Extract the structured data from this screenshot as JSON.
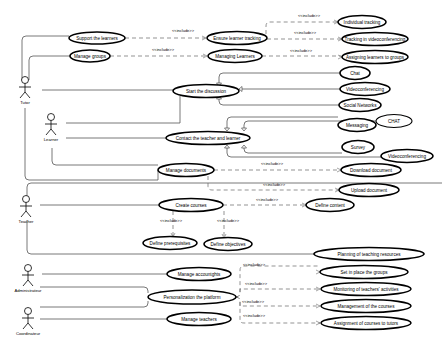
{
  "diagram": {
    "type": "UML use case diagram",
    "actors": [
      {
        "id": "tutor",
        "label": "Tutor",
        "x": 18,
        "y": 90
      },
      {
        "id": "learner",
        "label": "Learner",
        "x": 50,
        "y": 125
      },
      {
        "id": "teacher",
        "label": "Teacher",
        "x": 25,
        "y": 210
      },
      {
        "id": "administrator",
        "label": "Administrateur",
        "x": 28,
        "y": 273
      },
      {
        "id": "coordinator",
        "label": "Coordinateur",
        "x": 28,
        "y": 318
      }
    ],
    "use_cases": [
      {
        "id": "support",
        "label": "Support the learners",
        "cx": 97,
        "cy": 38,
        "rx": 28,
        "ry": 6
      },
      {
        "id": "manage_groups",
        "label": "Manage groups",
        "cx": 90,
        "cy": 56,
        "rx": 20,
        "ry": 6
      },
      {
        "id": "ensure_tracking",
        "label": "Ensure learner tracking",
        "cx": 237,
        "cy": 38,
        "rx": 30,
        "ry": 6.5
      },
      {
        "id": "managing_learners",
        "label": "Managing Learners",
        "cx": 235,
        "cy": 56,
        "rx": 27,
        "ry": 6.5
      },
      {
        "id": "individual_tracking",
        "label": "Individual tracking",
        "cx": 362,
        "cy": 22,
        "rx": 24,
        "ry": 6.5
      },
      {
        "id": "tracking_video",
        "label": "Tracking in videoconferencing",
        "cx": 375,
        "cy": 39,
        "rx": 33,
        "ry": 6.5
      },
      {
        "id": "assigning_groups",
        "label": "Assigning learners to groups",
        "cx": 375,
        "cy": 57,
        "rx": 33,
        "ry": 6.5
      },
      {
        "id": "start_discussion",
        "label": "Start the discussion",
        "cx": 206,
        "cy": 91,
        "rx": 33,
        "ry": 6.5
      },
      {
        "id": "chat",
        "label": "Chat",
        "cx": 355,
        "cy": 73,
        "rx": 15,
        "ry": 6.5
      },
      {
        "id": "videoconf1",
        "label": "Videoconferencing",
        "cx": 365,
        "cy": 89,
        "rx": 25,
        "ry": 6.5
      },
      {
        "id": "social",
        "label": "Social Networks",
        "cx": 360,
        "cy": 105,
        "rx": 21,
        "ry": 6.5
      },
      {
        "id": "contact",
        "label": "Contact the teacher and learner",
        "cx": 208,
        "cy": 138,
        "rx": 42,
        "ry": 6.5
      },
      {
        "id": "messaging",
        "label": "Messaging",
        "cx": 357,
        "cy": 125,
        "rx": 19,
        "ry": 6.5
      },
      {
        "id": "chat2",
        "label": "CHAT",
        "cx": 394,
        "cy": 121,
        "rx": 18,
        "ry": 6.5
      },
      {
        "id": "survey",
        "label": "Survey",
        "cx": 358,
        "cy": 147,
        "rx": 16,
        "ry": 6.5
      },
      {
        "id": "videoconf2",
        "label": "Videoconferencing",
        "cx": 407,
        "cy": 156,
        "rx": 26,
        "ry": 6.5
      },
      {
        "id": "manage_docs",
        "label": "Manage documents",
        "cx": 186,
        "cy": 170,
        "rx": 28,
        "ry": 6.5
      },
      {
        "id": "download_doc",
        "label": "Download document",
        "cx": 371,
        "cy": 170,
        "rx": 30,
        "ry": 6.5
      },
      {
        "id": "upload_doc",
        "label": "Upload document",
        "cx": 369,
        "cy": 190,
        "rx": 30,
        "ry": 6.5
      },
      {
        "id": "create_courses",
        "label": "Create courses",
        "cx": 191,
        "cy": 205,
        "rx": 32,
        "ry": 6.5
      },
      {
        "id": "define_content",
        "label": "Define content",
        "cx": 330,
        "cy": 205,
        "rx": 24,
        "ry": 6.5
      },
      {
        "id": "define_prereq",
        "label": "Define prerequisites",
        "cx": 170,
        "cy": 243,
        "rx": 27,
        "ry": 6.5
      },
      {
        "id": "define_obj",
        "label": "Define objectives",
        "cx": 228,
        "cy": 244,
        "rx": 24,
        "ry": 6.5
      },
      {
        "id": "planning",
        "label": "Planning of teaching resources",
        "cx": 369,
        "cy": 254,
        "rx": 55,
        "ry": 6.5
      },
      {
        "id": "manage_accounts",
        "label": "Manage accountghts",
        "cx": 199,
        "cy": 274,
        "rx": 32,
        "ry": 6.5
      },
      {
        "id": "personalization",
        "label": "Personalization the platform",
        "cx": 192,
        "cy": 297,
        "rx": 44,
        "ry": 7
      },
      {
        "id": "manage_teachers",
        "label": "Manage teachers",
        "cx": 199,
        "cy": 319,
        "rx": 32,
        "ry": 6.5
      },
      {
        "id": "set_groups",
        "label": "Set in place the groups",
        "cx": 364,
        "cy": 272,
        "rx": 44,
        "ry": 6.5
      },
      {
        "id": "monitoring",
        "label": "Monitoring of teachers' activities",
        "cx": 366,
        "cy": 289,
        "rx": 45,
        "ry": 6.5
      },
      {
        "id": "management_courses",
        "label": "Management of the courses",
        "cx": 366,
        "cy": 306,
        "rx": 45,
        "ry": 6.5
      },
      {
        "id": "assignment_tutors",
        "label": "Assignment of courses to tutors",
        "cx": 366,
        "cy": 323,
        "rx": 45,
        "ry": 6.5
      }
    ],
    "include_label": "<<include>>",
    "includes": [
      {
        "from": "support",
        "to": "ensure_tracking",
        "label_x": 172,
        "label_y": 32
      },
      {
        "from": "manage_groups",
        "to": "managing_learners",
        "label_x": 152,
        "label_y": 51
      },
      {
        "from": "ensure_tracking",
        "to": "individual_tracking",
        "label_x": 298,
        "label_y": 17
      },
      {
        "from": "ensure_tracking",
        "to": "tracking_video",
        "label_x": 294,
        "label_y": 34
      },
      {
        "from": "managing_learners",
        "to": "assigning_groups",
        "label_x": 290,
        "label_y": 52
      },
      {
        "from": "manage_docs",
        "to": "download_doc",
        "label_x": 261,
        "label_y": 165
      },
      {
        "from": "manage_docs",
        "to": "upload_doc",
        "label_x": 263,
        "label_y": 186
      },
      {
        "from": "create_courses",
        "to": "define_content",
        "label_x": 256,
        "label_y": 201
      },
      {
        "from": "create_courses",
        "to": "define_prereq",
        "label_x": 160,
        "label_y": 222
      },
      {
        "from": "create_courses",
        "to": "define_obj",
        "label_x": 217,
        "label_y": 222
      },
      {
        "from": "personalization",
        "to": "set_groups",
        "label_x": 243,
        "label_y": 266
      },
      {
        "from": "personalization",
        "to": "monitoring",
        "label_x": 245,
        "label_y": 285
      },
      {
        "from": "personalization",
        "to": "management_courses",
        "label_x": 242,
        "label_y": 303
      },
      {
        "from": "personalization",
        "to": "assignment_tutors",
        "label_x": 243,
        "label_y": 317
      }
    ],
    "generalizations": [
      {
        "child": "chat",
        "parent": "start_discussion"
      },
      {
        "child": "videoconf1",
        "parent": "start_discussion"
      },
      {
        "child": "social",
        "parent": "start_discussion"
      },
      {
        "child": "messaging",
        "parent": "contact"
      },
      {
        "child": "chat2",
        "parent": "contact"
      },
      {
        "child": "survey",
        "parent": "contact"
      },
      {
        "child": "videoconf2",
        "parent": "contact"
      }
    ]
  }
}
